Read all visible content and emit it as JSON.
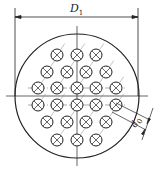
{
  "diagram": {
    "labels": {
      "outer_diameter": "D",
      "outer_diameter_sub": "1",
      "tube_diameter": "d",
      "tube_diameter_sub": "0"
    },
    "shell": {
      "cx": 77,
      "cy": 96,
      "r": 62
    },
    "tube_radius": 6,
    "tube_rows": [
      {
        "y": 55,
        "x": [
          57,
          77,
          96
        ]
      },
      {
        "y": 72,
        "x": [
          47,
          67,
          86,
          106
        ]
      },
      {
        "y": 88,
        "x": [
          38,
          57,
          77,
          96,
          116
        ]
      },
      {
        "y": 105,
        "x": [
          38,
          57,
          77,
          96,
          116
        ]
      },
      {
        "y": 122,
        "x": [
          47,
          67,
          86,
          106
        ]
      },
      {
        "y": 140,
        "x": [
          57,
          77,
          96
        ]
      }
    ],
    "colors": {
      "line": "#222222",
      "background": "#ffffff"
    }
  }
}
